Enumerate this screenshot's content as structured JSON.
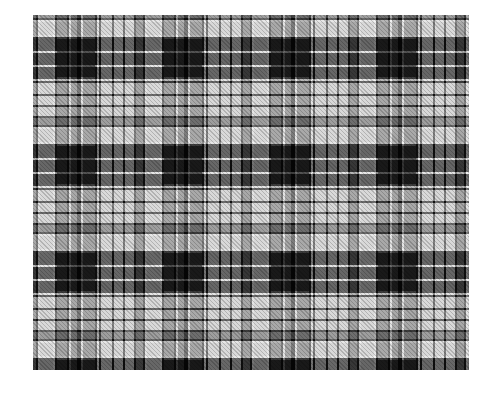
{
  "image": {
    "subject": "black, white and grey tartan plaid fabric swatch",
    "colors": {
      "black": "#0a0a0a",
      "grey": "#6e6e6e",
      "light": "#d9d9d9",
      "white": "#f2f2f2",
      "background": "#ffffff"
    },
    "swatch_bounds": {
      "x": 33,
      "y": 15,
      "width": 436,
      "height": 355
    },
    "sett_size_px": 107,
    "repeats_horizontal": 4,
    "repeats_vertical": 3.3
  }
}
